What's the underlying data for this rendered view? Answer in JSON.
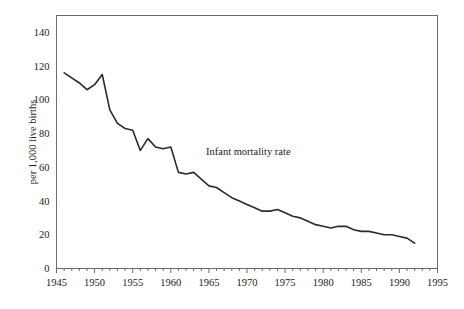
{
  "chart_data": {
    "type": "line",
    "title": "",
    "subtitle": "",
    "annotation": "Infant mortality rate",
    "xlabel": "",
    "ylabel": "per 1,000 live births",
    "xlim": [
      1945,
      1995
    ],
    "ylim": [
      0,
      150
    ],
    "grid": false,
    "legend_position": "none",
    "x_ticks": [
      1945,
      1950,
      1955,
      1960,
      1965,
      1970,
      1975,
      1980,
      1985,
      1990,
      1995
    ],
    "x_tick_labels": [
      "1945",
      "1950",
      "1955",
      "1960",
      "1965",
      "1970",
      "1975",
      "1980",
      "1985",
      "1990",
      "1995"
    ],
    "x_minor_tick_interval": 1,
    "y_ticks": [
      0,
      20,
      40,
      60,
      80,
      100,
      120,
      140
    ],
    "y_tick_labels": [
      "0",
      "20",
      "40",
      "60",
      "80",
      "100",
      "120",
      "140"
    ],
    "line_color": "#2b2b2b",
    "frame_color": "#6b6b6b",
    "series": [
      {
        "name": "Infant mortality rate",
        "x": [
          1946,
          1947,
          1948,
          1949,
          1950,
          1951,
          1952,
          1953,
          1954,
          1955,
          1956,
          1957,
          1958,
          1959,
          1960,
          1961,
          1962,
          1963,
          1964,
          1965,
          1966,
          1967,
          1968,
          1969,
          1970,
          1971,
          1972,
          1973,
          1974,
          1975,
          1976,
          1977,
          1978,
          1979,
          1980,
          1981,
          1982,
          1983,
          1984,
          1985,
          1986,
          1987,
          1988,
          1989,
          1990,
          1991,
          1992
        ],
        "values": [
          116,
          113,
          110,
          106,
          109,
          115,
          94,
          86,
          83,
          82,
          70,
          77,
          72,
          71,
          72,
          57,
          56,
          57,
          53,
          49,
          48,
          45,
          42,
          40,
          38,
          36,
          34,
          34,
          35,
          33,
          31,
          30,
          28,
          26,
          25,
          24,
          25,
          25,
          23,
          22,
          22,
          21,
          20,
          20,
          19,
          18,
          15
        ]
      }
    ]
  },
  "axis": {
    "y_title": "per 1,000 live births"
  },
  "annotations": {
    "series_label": "Infant mortality rate"
  }
}
